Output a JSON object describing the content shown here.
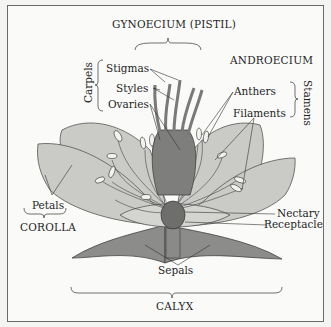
{
  "diagram": {
    "group_labels": {
      "gynoecium": "GYNOECIUM (PISTIL)",
      "androecium": "ANDROECIUM",
      "corolla": "COROLLA",
      "calyx": "CALYX",
      "carpels": "Carpels",
      "stamens": "Stamens"
    },
    "part_labels": {
      "stigmas": "Stigmas",
      "styles": "Styles",
      "ovaries": "Ovaries",
      "anthers": "Anthers",
      "filaments": "Filaments",
      "petals": "Petals",
      "nectary": "Nectary",
      "receptacle": "Receptacle",
      "sepals": "Sepals"
    },
    "colors": {
      "petal": "#c9c9c6",
      "sepal": "#8a8a88",
      "pistil": "#7c7c7a",
      "nectary": "#6e6e6c",
      "line": "#333333",
      "text": "#1e1e1e",
      "border": "#6a6a6a"
    }
  }
}
